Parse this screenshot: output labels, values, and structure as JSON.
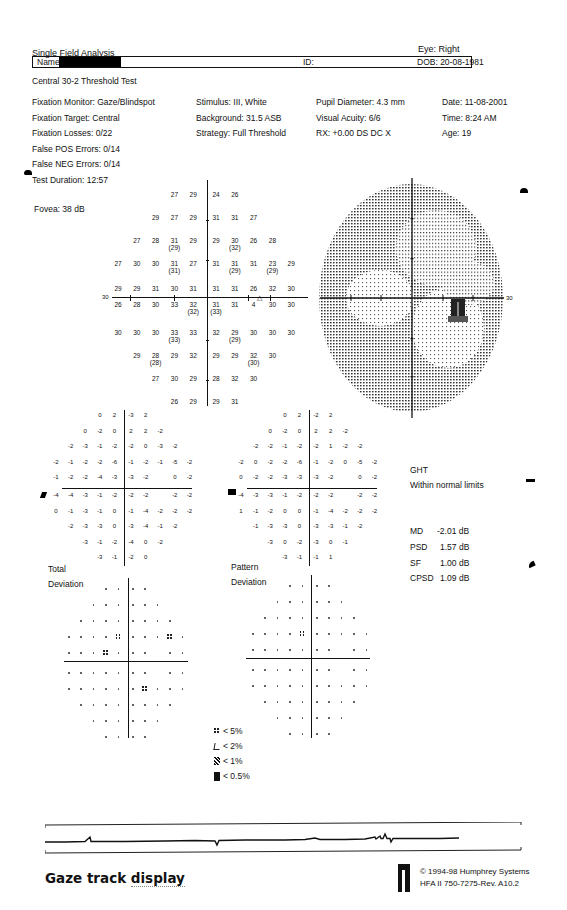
{
  "header": {
    "report_title": "Single Field Analysis",
    "eye": "Eye: Right",
    "name_label": "Name:",
    "id_label": "ID:",
    "dob": "DOB: 20-08-1981",
    "test_name": "Central 30-2 Threshold Test"
  },
  "params": {
    "col1": [
      "Fixation Monitor: Gaze/Blindspot",
      "Fixation Target: Central",
      "Fixation Losses: 0/22",
      "False POS Errors: 0/14",
      "False NEG Errors: 0/14",
      "Test Duration: 12:57"
    ],
    "fovea": "Fovea: 38 dB",
    "col2": [
      "Stimulus: III, White",
      "Background: 31.5 ASB",
      "Strategy: Full Threshold"
    ],
    "col3": [
      "Pupil Diameter: 4.3 mm",
      "Visual Acuity: 6/6",
      "RX: +0.00 DS      DC  X"
    ],
    "col4": [
      "Date: 11-08-2001",
      "Time:  8:24 AM",
      "Age: 19"
    ]
  },
  "threshold_plot": {
    "axis_label": "30",
    "rows": [
      [
        "",
        "",
        "",
        "27",
        "29",
        "24",
        "26",
        "",
        "",
        ""
      ],
      [
        "",
        "",
        "29",
        "27",
        "29",
        "31",
        "31",
        "27",
        "",
        ""
      ],
      [
        "",
        "27",
        "28",
        "31|29",
        "29",
        "29",
        "30|32",
        "26",
        "28",
        ""
      ],
      [
        "27",
        "30",
        "30",
        "31|31",
        "27",
        "31",
        "31|29",
        "31",
        "23|29",
        "29"
      ],
      [
        "29",
        "29",
        "31",
        "30",
        "31",
        "31",
        "31",
        "26",
        "32",
        "30"
      ],
      [
        "26",
        "28",
        "30",
        "33",
        "32|32",
        "31|33",
        "31",
        "4",
        "30",
        "30"
      ],
      [
        "30",
        "30",
        "30",
        "33|33",
        "33",
        "32",
        "29|29",
        "30",
        "30",
        "30"
      ],
      [
        "",
        "29",
        "28|28",
        "29",
        "32",
        "29",
        "29",
        "32|30",
        "30",
        ""
      ],
      [
        "",
        "",
        "27",
        "30",
        "29",
        "28",
        "32",
        "30",
        "",
        ""
      ],
      [
        "",
        "",
        "",
        "26",
        "29",
        "29",
        "31",
        "",
        "",
        ""
      ]
    ],
    "blindspot_marker": "△"
  },
  "greyscale_plot": {
    "axis_label": "30"
  },
  "total_deviation": {
    "rows": [
      [
        "",
        "",
        "",
        "0",
        "2",
        "-3",
        "2",
        "",
        "",
        ""
      ],
      [
        "",
        "",
        "0",
        "-2",
        "0",
        "2",
        "2",
        "-2",
        "",
        ""
      ],
      [
        "",
        "-2",
        "-3",
        "-1",
        "-2",
        "-2",
        "0",
        "-3",
        "-2",
        ""
      ],
      [
        "-2",
        "-1",
        "-2",
        "-2",
        "-6",
        "-1",
        "-2",
        "-1",
        "-5",
        "-2"
      ],
      [
        "-1",
        "-2",
        "-2",
        "-4",
        "-3",
        "-3",
        "-2",
        "",
        "0",
        "-2"
      ],
      [
        "-4",
        "-4",
        "-3",
        "-1",
        "-2",
        "-2",
        "-2",
        "",
        "-2",
        "-2"
      ],
      [
        "0",
        "-1",
        "-3",
        "-1",
        "0",
        "-1",
        "-4",
        "-2",
        "-2",
        "-2"
      ],
      [
        "",
        "-2",
        "-3",
        "-3",
        "0",
        "-3",
        "-4",
        "-1",
        "-2",
        ""
      ],
      [
        "",
        "",
        "-3",
        "-1",
        "-2",
        "-4",
        "0",
        "-2",
        "",
        ""
      ],
      [
        "",
        "",
        "",
        "-3",
        "-1",
        "-2",
        "0",
        "",
        "",
        ""
      ]
    ],
    "label_line1": "Total",
    "label_line2": "Deviation",
    "prob_rows": [
      [
        "",
        "",
        "",
        ".",
        ".",
        ".",
        ".",
        "",
        "",
        ""
      ],
      [
        "",
        "",
        ".",
        ".",
        ".",
        ".",
        ".",
        ".",
        "",
        ""
      ],
      [
        "",
        ".",
        ".",
        ".",
        ".",
        ".",
        ".",
        ".",
        ".",
        ""
      ],
      [
        ".",
        ".",
        ".",
        ".",
        "5",
        ".",
        ".",
        ".",
        "5",
        "."
      ],
      [
        ".",
        ".",
        ".",
        "5",
        ".",
        ".",
        ".",
        "",
        ".",
        "."
      ],
      [
        ".",
        ".",
        ".",
        ".",
        ".",
        ".",
        ".",
        "",
        ".",
        "."
      ],
      [
        ".",
        ".",
        ".",
        ".",
        ".",
        ".",
        "5",
        ".",
        ".",
        "."
      ],
      [
        "",
        ".",
        ".",
        ".",
        ".",
        ".",
        ".",
        ".",
        ".",
        ""
      ],
      [
        "",
        "",
        ".",
        ".",
        ".",
        ".",
        ".",
        ".",
        "",
        ""
      ],
      [
        "",
        "",
        "",
        ".",
        ".",
        ".",
        ".",
        "",
        "",
        ""
      ]
    ]
  },
  "pattern_deviation": {
    "rows": [
      [
        "",
        "",
        "",
        "0",
        "2",
        "-2",
        "2",
        "",
        "",
        ""
      ],
      [
        "",
        "",
        "0",
        "-2",
        "0",
        "2",
        "2",
        "-2",
        "",
        ""
      ],
      [
        "",
        "-2",
        "-2",
        "-1",
        "-2",
        "-2",
        "1",
        "-2",
        "-2",
        ""
      ],
      [
        "-2",
        "0",
        "-2",
        "-2",
        "-6",
        "-1",
        "-2",
        "0",
        "-5",
        "-2"
      ],
      [
        "0",
        "-2",
        "-2",
        "-3",
        "-3",
        "-3",
        "-2",
        "",
        "0",
        "-2"
      ],
      [
        "-4",
        "-3",
        "-3",
        "-1",
        "-2",
        "-2",
        "-2",
        "",
        "-2",
        "-2"
      ],
      [
        "1",
        "-1",
        "-2",
        "0",
        "0",
        "-1",
        "-4",
        "-2",
        "-2",
        "-2"
      ],
      [
        "",
        "-1",
        "-3",
        "-3",
        "0",
        "-3",
        "-3",
        "-1",
        "-2",
        ""
      ],
      [
        "",
        "",
        "-3",
        "0",
        "-2",
        "-3",
        "0",
        "-1",
        "",
        ""
      ],
      [
        "",
        "",
        "",
        "-3",
        "-1",
        "-1",
        "1",
        "",
        "",
        ""
      ]
    ],
    "label_line1": "Pattern",
    "label_line2": "Deviation",
    "prob_rows": [
      [
        "",
        "",
        "",
        ".",
        ".",
        ".",
        ".",
        "",
        "",
        ""
      ],
      [
        "",
        "",
        ".",
        ".",
        ".",
        ".",
        ".",
        ".",
        "",
        ""
      ],
      [
        "",
        ".",
        ".",
        ".",
        ".",
        ".",
        ".",
        ".",
        ".",
        ""
      ],
      [
        ".",
        ".",
        ".",
        ".",
        "5",
        ".",
        ".",
        ".",
        ".",
        "."
      ],
      [
        ".",
        ".",
        ".",
        ".",
        ".",
        ".",
        ".",
        "",
        ".",
        "."
      ],
      [
        ".",
        ".",
        ".",
        ".",
        ".",
        ".",
        ".",
        "",
        ".",
        "."
      ],
      [
        ".",
        ".",
        ".",
        ".",
        ".",
        ".",
        ".",
        ".",
        ".",
        "."
      ],
      [
        "",
        ".",
        ".",
        ".",
        ".",
        ".",
        ".",
        ".",
        ".",
        ""
      ],
      [
        "",
        "",
        ".",
        ".",
        ".",
        ".",
        ".",
        ".",
        "",
        ""
      ],
      [
        "",
        "",
        "",
        ".",
        ".",
        ".",
        ".",
        "",
        "",
        ""
      ]
    ]
  },
  "ght": {
    "title": "GHT",
    "result": "Within normal limits"
  },
  "global_indices": [
    {
      "key": "MD",
      "value": "-2.01 dB"
    },
    {
      "key": "PSD",
      "value": "1.57 dB"
    },
    {
      "key": "SF",
      "value": "1.00 dB"
    },
    {
      "key": "CPSD",
      "value": "1.09 dB"
    }
  ],
  "legend": [
    {
      "symbol": "p5",
      "label": "< 5%"
    },
    {
      "symbol": "p2",
      "label": "< 2%"
    },
    {
      "symbol": "p1",
      "label": "< 1%"
    },
    {
      "symbol": "p05",
      "label": "< 0.5%"
    }
  ],
  "footer": {
    "caption_a": "Gaze track ",
    "caption_b": "display",
    "copyright": "© 1994-98 Humphrey Systems",
    "model": "HFA II 750-7275-Rev. A10.2"
  }
}
